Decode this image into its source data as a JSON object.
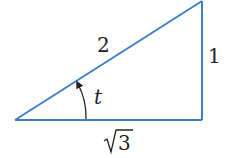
{
  "diagram": {
    "type": "right-triangle",
    "line_color": "#3d7fc7",
    "text_color": "#222222",
    "vertices": {
      "left": [
        15,
        120
      ],
      "bottom_right": [
        202,
        120
      ],
      "top_right": [
        202,
        1
      ]
    },
    "labels": {
      "hypotenuse": "2",
      "opposite": "1",
      "adjacent_radicand": "3",
      "angle": "t"
    }
  }
}
